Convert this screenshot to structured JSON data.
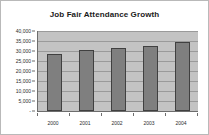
{
  "chart_data": {
    "type": "bar",
    "title": "Job Fair Attendance Growth",
    "xlabel": "",
    "ylabel": "",
    "categories": [
      "2000",
      "2001",
      "2002",
      "2003",
      "2004"
    ],
    "values": [
      28500,
      30500,
      31500,
      32500,
      34500
    ],
    "ylim": [
      0,
      40000
    ],
    "ytick_values": [
      0,
      5000,
      10000,
      15000,
      20000,
      25000,
      30000,
      35000,
      40000
    ],
    "ytick_labels": [
      "-",
      "5,000",
      "10,000",
      "15,000",
      "20,000",
      "25,000",
      "30,000",
      "35,000",
      "40,000"
    ],
    "grid": true,
    "legend": false,
    "legend_position": "none",
    "colors": {
      "bar_fill": "#7f7f7f",
      "bar_border": "#404040",
      "plot_background": "#c3c3c3",
      "gridline": "#9a9a9a",
      "axis_line": "#6d6d6d",
      "frame_background": "#ffffff",
      "frame_border": "#b9b9b9",
      "title_text": "#1a1a1a",
      "tick_text": "#2b2b2b"
    }
  }
}
